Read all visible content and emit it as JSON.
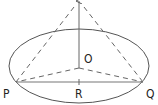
{
  "diagram": {
    "type": "cone-geometry",
    "labels": {
      "O": "O",
      "P": "P",
      "Q": "Q",
      "R": "R"
    },
    "colors": {
      "stroke": "#555555",
      "text": "#222222",
      "background": "#ffffff"
    }
  }
}
